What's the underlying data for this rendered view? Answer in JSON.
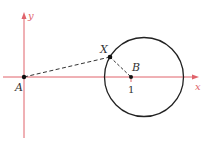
{
  "diagram": {
    "axes": {
      "x_label": "x",
      "y_label": "y",
      "color": "#e0636b"
    },
    "points": {
      "A": {
        "label": "A",
        "x": 24,
        "y": 77
      },
      "B": {
        "label": "B",
        "x": 131,
        "y": 77
      },
      "X": {
        "label": "X",
        "x": 110,
        "y": 57
      }
    },
    "tick_label": "1",
    "circle": {
      "cx": 144,
      "cy": 77,
      "r": 39,
      "color": "#222222"
    },
    "segments": [
      {
        "from": "A",
        "to": "X",
        "style": "dashed"
      },
      {
        "from": "X",
        "to": "B",
        "style": "dashed"
      }
    ]
  }
}
